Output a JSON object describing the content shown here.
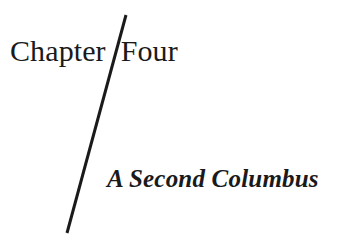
{
  "page": {
    "background_color": "#ffffff",
    "text_color": "#1a1a1a"
  },
  "heading": {
    "label": "Chapter",
    "number_word": "Four",
    "full_text": "Chapter Four"
  },
  "subtitle": {
    "text": "A Second Columbus"
  },
  "rule": {
    "name": "diagonal-rule",
    "color": "#1a1a1a",
    "stroke_width": 3,
    "x1": 126,
    "y1": 15,
    "x2": 67,
    "y2": 233
  }
}
